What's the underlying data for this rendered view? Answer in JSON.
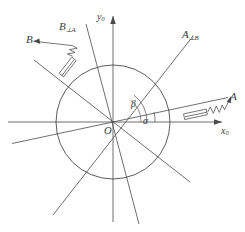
{
  "figure": {
    "kind": "mechanics-vector-diagram",
    "stroke_color": "#4a4a4a",
    "label_color": "#3a3a3a",
    "circle": {
      "center_x": 113,
      "center_y": 122,
      "radius": 57
    },
    "axes": {
      "x_label_base": "x",
      "x_label_sub": "0",
      "y_label_base": "y",
      "y_label_sub": "0",
      "origin_label": "O"
    },
    "angles": [
      {
        "name": "alpha",
        "glyph": "α",
        "measure_deg": 12,
        "from": "x0-axis",
        "to": "A-direction"
      },
      {
        "name": "beta",
        "glyph": "β",
        "measure_deg": 52,
        "from": "x0-axis",
        "to": "A-perp-B-direction"
      }
    ],
    "vectors": [
      {
        "name": "A",
        "label_base": "A",
        "label_sub": "",
        "angle_deg": 12,
        "has_spring_damper": true,
        "has_arrow": true
      },
      {
        "name": "B",
        "label_base": "B",
        "label_sub": "",
        "angle_deg": 142,
        "has_spring_damper": true,
        "has_arrow": true
      },
      {
        "name": "A-perp-B",
        "label_base": "A",
        "label_sub": "⊥B",
        "angle_deg": 52,
        "has_spring_damper": false,
        "has_arrow": false
      },
      {
        "name": "B-perp-A",
        "label_base": "B",
        "label_sub": "⊥A",
        "angle_deg": 76,
        "has_spring_damper": false,
        "has_arrow": false
      }
    ]
  }
}
